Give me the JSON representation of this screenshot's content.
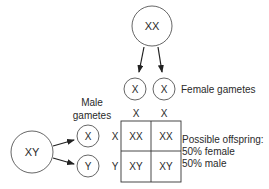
{
  "diagram": {
    "colors": {
      "stroke": "#333333",
      "text": "#2a2a2a",
      "background": "#ffffff"
    },
    "parents": {
      "female": {
        "label": "XX"
      },
      "male": {
        "label": "XY"
      }
    },
    "female_gametes": {
      "caption": "Female gametes",
      "items": [
        {
          "label": "X"
        },
        {
          "label": "X"
        }
      ]
    },
    "male_gametes": {
      "caption_line1": "Male",
      "caption_line2": "gametes",
      "items": [
        {
          "label": "X"
        },
        {
          "label": "Y"
        }
      ]
    },
    "punnett": {
      "col_headers": [
        "X",
        "X"
      ],
      "row_headers": [
        "X",
        "Y"
      ],
      "cells": [
        [
          "XX",
          "XX"
        ],
        [
          "XY",
          "XY"
        ]
      ]
    },
    "offspring": {
      "line1": "Possible offspring:",
      "line2": "50% female",
      "line3": "50% male"
    }
  }
}
